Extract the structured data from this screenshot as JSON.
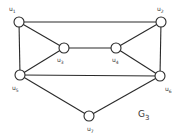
{
  "diagram": {
    "type": "undirected-graph",
    "graph_label": {
      "main": "G",
      "sub": "3",
      "x": 138,
      "y": 117
    },
    "style": {
      "edge_color": "#2a2a2a",
      "node_fill": "#ffffff",
      "node_stroke": "#2a2a2a",
      "node_radius": 5
    },
    "nodes": [
      {
        "id": "u1",
        "label": "u",
        "sub": "1",
        "x": 19,
        "y": 22,
        "lx": 9,
        "ly": 11
      },
      {
        "id": "u2",
        "label": "u",
        "sub": "2",
        "x": 161,
        "y": 22,
        "lx": 157,
        "ly": 11
      },
      {
        "id": "u3",
        "label": "u",
        "sub": "3",
        "x": 64,
        "y": 48,
        "lx": 57,
        "ly": 62
      },
      {
        "id": "u4",
        "label": "u",
        "sub": "4",
        "x": 116,
        "y": 48,
        "lx": 112,
        "ly": 62
      },
      {
        "id": "u5",
        "label": "u",
        "sub": "5",
        "x": 20,
        "y": 75,
        "lx": 12,
        "ly": 90
      },
      {
        "id": "u6",
        "label": "u",
        "sub": "6",
        "x": 160,
        "y": 76,
        "lx": 165,
        "ly": 91
      },
      {
        "id": "u7",
        "label": "u",
        "sub": "7",
        "x": 89,
        "y": 116,
        "lx": 87,
        "ly": 131
      }
    ],
    "edges": [
      [
        "u1",
        "u2"
      ],
      [
        "u1",
        "u3"
      ],
      [
        "u1",
        "u5"
      ],
      [
        "u2",
        "u4"
      ],
      [
        "u2",
        "u6"
      ],
      [
        "u3",
        "u4"
      ],
      [
        "u3",
        "u5"
      ],
      [
        "u4",
        "u6"
      ],
      [
        "u5",
        "u6"
      ],
      [
        "u5",
        "u7"
      ],
      [
        "u6",
        "u7"
      ]
    ]
  }
}
